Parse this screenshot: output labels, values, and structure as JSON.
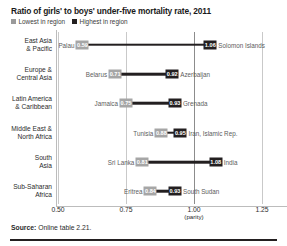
{
  "header": {
    "title": "Ratio of girls' to boys' under-five mortality rate, 2011",
    "legend": [
      {
        "label": "Lowest in region",
        "color": "#9a9a9a",
        "key": "low"
      },
      {
        "label": "Highest in region",
        "color": "#231f20",
        "key": "high"
      }
    ]
  },
  "footer": {
    "source_label": "Source:",
    "source_text": "Online table 2.21."
  },
  "chart_data": {
    "type": "bar",
    "subtype": "dumbbell-range",
    "title": "Ratio of girls' to boys' under-five mortality rate, 2011",
    "xlabel": "",
    "ylabel": "",
    "xlim": [
      0.5,
      1.25
    ],
    "xticks": [
      "0.50",
      "0.75",
      "1.00",
      "1.25"
    ],
    "xtick_values": [
      0.5,
      0.75,
      1.0,
      1.25
    ],
    "parity_note": "(parity)",
    "parity_value": 1.0,
    "grid": true,
    "legend_position": "top-left",
    "categories": [
      "East Asia & Pacific",
      "Europe & Central Asia",
      "Latin America & Caribbean",
      "Middle East & North Africa",
      "South Asia",
      "Sub-Saharan Africa"
    ],
    "series": [
      {
        "name": "Lowest in region",
        "values": [
          0.59,
          0.71,
          0.75,
          0.88,
          0.81,
          0.84
        ],
        "labels": [
          "0.59",
          "0.71",
          "0.75",
          "0.88",
          "0.81",
          "0.84"
        ],
        "countries": [
          "Palau",
          "Belarus",
          "Jamaica",
          "Tunisia",
          "Sri Lanka",
          "Eritrea"
        ]
      },
      {
        "name": "Highest in region",
        "values": [
          1.06,
          0.92,
          0.93,
          0.95,
          1.08,
          0.93
        ],
        "labels": [
          "1.06",
          "0.92",
          "0.93",
          "0.95",
          "1.08",
          "0.93"
        ],
        "countries": [
          "Solomon Islands",
          "Azerbaijan",
          "Grenada",
          "Iran, Islamic Rep.",
          "India",
          "South Sudan"
        ]
      }
    ],
    "rows": [
      {
        "region_line1": "East Asia",
        "region_line2": "& Pacific",
        "low_country": "Palau",
        "low_label": "0.59",
        "low_value": 0.59,
        "high_country": "Solomon Islands",
        "high_label": "1.06",
        "high_value": 1.06
      },
      {
        "region_line1": "Europe &",
        "region_line2": "Central Asia",
        "low_country": "Belarus",
        "low_label": "0.71",
        "low_value": 0.71,
        "high_country": "Azerbaijan",
        "high_label": "0.92",
        "high_value": 0.92
      },
      {
        "region_line1": "Latin America",
        "region_line2": "& Caribbean",
        "low_country": "Jamaica",
        "low_label": "0.75",
        "low_value": 0.75,
        "high_country": "Grenada",
        "high_label": "0.93",
        "high_value": 0.93
      },
      {
        "region_line1": "Middle East &",
        "region_line2": "North Africa",
        "low_country": "Tunisia",
        "low_label": "0.88",
        "low_value": 0.88,
        "high_country": "Iran, Islamic Rep.",
        "high_label": "0.95",
        "high_value": 0.95
      },
      {
        "region_line1": "South",
        "region_line2": "Asia",
        "low_country": "Sri Lanka",
        "low_label": "0.81",
        "low_value": 0.81,
        "high_country": "India",
        "high_label": "1.08",
        "high_value": 1.08
      },
      {
        "region_line1": "Sub-Saharan",
        "region_line2": "Africa",
        "low_country": "Eritrea",
        "low_label": "0.84",
        "low_value": 0.84,
        "high_country": "South Sudan",
        "high_label": "0.93",
        "high_value": 0.93
      }
    ]
  }
}
